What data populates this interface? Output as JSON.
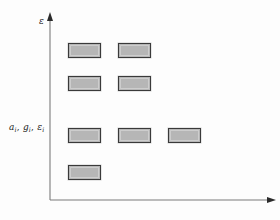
{
  "figure": {
    "background_color": "#fdfdfd",
    "axes": {
      "y_axis_label": "ε",
      "x_axis_label": "",
      "axis_color": "#7b7b7b",
      "origin_x": 50,
      "origin_y": 200,
      "y_top": 14,
      "x_right": 274
    },
    "annotation": {
      "symbol_a": "a",
      "symbol_g": "g",
      "symbol_eps": "ε",
      "subscript": "i",
      "separator": ", ",
      "full_text": "aᵢ, gᵢ, εᵢ"
    },
    "style": {
      "box_fill": "#b6b6b6",
      "box_border": "#3a3a3a"
    }
  },
  "chart_data": {
    "type": "scatter",
    "title": "",
    "xlabel": "",
    "ylabel": "ε",
    "grid": false,
    "legend": null,
    "levels": [
      {
        "level_index": 1,
        "energy_label": "",
        "y_px": 43,
        "count": 2,
        "x_positions_px": [
          68,
          118
        ]
      },
      {
        "level_index": 2,
        "energy_label": "",
        "y_px": 76,
        "count": 2,
        "x_positions_px": [
          68,
          118
        ]
      },
      {
        "level_index": 3,
        "energy_label": "aᵢ, gᵢ, εᵢ",
        "y_px": 128,
        "count": 3,
        "x_positions_px": [
          68,
          118,
          168
        ]
      },
      {
        "level_index": 4,
        "energy_label": "",
        "y_px": 165,
        "count": 1,
        "x_positions_px": [
          68
        ]
      }
    ],
    "box_size_px": {
      "width": 33,
      "height": 15
    },
    "xlim": [
      50,
      274
    ],
    "ylim": [
      200,
      14
    ]
  }
}
